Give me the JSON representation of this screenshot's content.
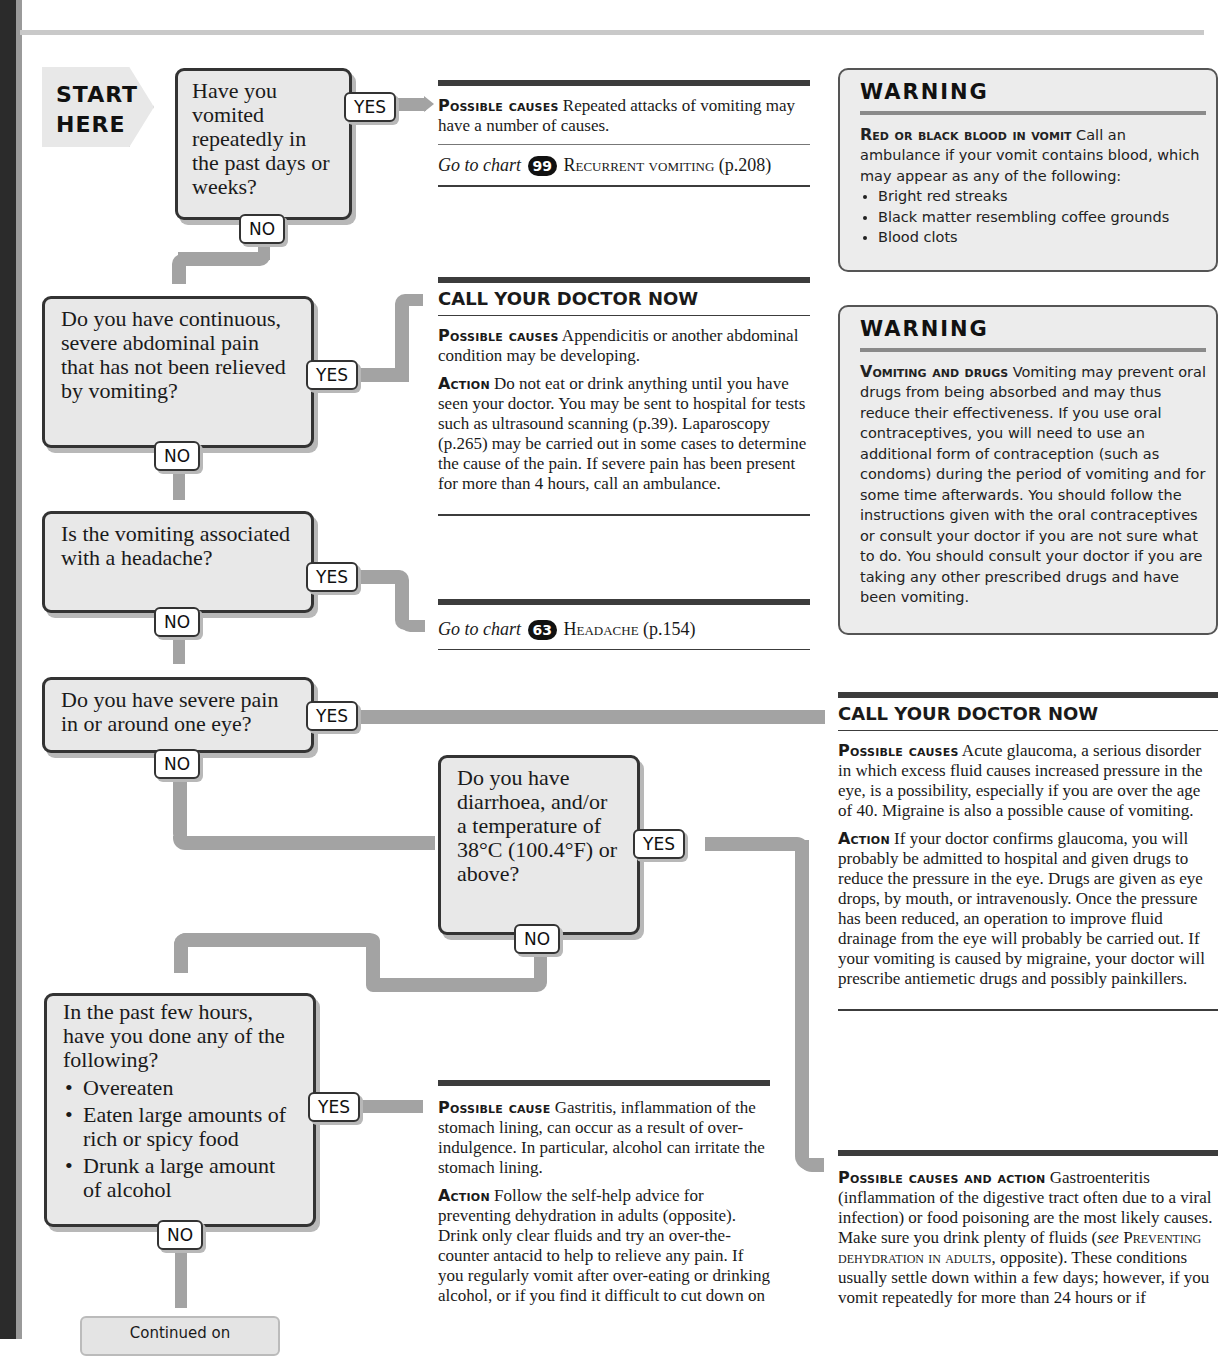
{
  "page": {
    "header_fragment": "…in the past, vigorous or sudden…",
    "start": {
      "line1": "START",
      "line2": "HERE"
    }
  },
  "labels": {
    "yes": "YES",
    "no": "NO"
  },
  "questions": [
    {
      "id": "q1",
      "text": "Have you vomited repeatedly in the past days or weeks?"
    },
    {
      "id": "q2",
      "text": "Do you have continuous, severe abdominal pain that has not been relieved by vomiting?"
    },
    {
      "id": "q3",
      "text": "Is the vomiting associated with a headache?"
    },
    {
      "id": "q4",
      "text": "Do you have severe pain in or around one eye?"
    },
    {
      "id": "q5",
      "text": "Do you have diarrhoea, and/or a temperature of 38°C (100.4°F) or above?"
    },
    {
      "id": "q6",
      "text": "In the past few hours, have you done any of the following?",
      "bullets": [
        "Overeaten",
        "Eaten large amounts of rich or spicy food",
        "Drunk a large amount of alcohol"
      ]
    }
  ],
  "outcomes": {
    "recurrent": {
      "lead": "Possible causes",
      "text": "Repeated attacks of vomiting may have a number of causes.",
      "goto_prefix": "Go to chart",
      "chart_number": "99",
      "chart_name": "Recurrent vomiting",
      "chart_page": "(p.208)"
    },
    "abdominal": {
      "heading": "CALL YOUR DOCTOR NOW",
      "causes_lead": "Possible causes",
      "causes_text": "Appendicitis or another abdominal condition may be developing.",
      "action_lead": "Action",
      "action_text": "Do not eat or drink anything until you have seen your doctor. You may be sent to hospital for tests such as ultrasound scanning (p.39). Laparoscopy (p.265) may be carried out in some cases to determine the cause of the pain. If severe pain has been present for more than 4 hours, call an ambulance."
    },
    "headache": {
      "goto_prefix": "Go to chart",
      "chart_number": "63",
      "chart_name": "Headache",
      "chart_page": "(p.154)"
    },
    "eye": {
      "heading": "CALL YOUR DOCTOR NOW",
      "causes_lead": "Possible causes",
      "causes_text": "Acute glaucoma, a serious disorder in which excess fluid causes increased pressure in the eye, is a possibility, especially if you are over the age of 40. Migraine is also a possible cause of vomiting.",
      "action_lead": "Action",
      "action_text": "If your doctor confirms glaucoma, you will probably be admitted to hospital and given drugs to reduce the pressure in the eye. Drugs are given as eye drops, by mouth, or intravenously. Once the pressure has been reduced, an operation to improve fluid drainage from the eye will probably be carried out. If your vomiting is caused by migraine, your doctor will prescribe antiemetic drugs and possibly painkillers."
    },
    "gastritis": {
      "causes_lead": "Possible cause",
      "causes_text": "Gastritis, inflammation of the stomach lining, can occur as a result of over-indulgence. In particular, alcohol can irritate the stomach lining.",
      "action_lead": "Action",
      "action_text": "Follow the self-help advice for preventing dehydration in adults (opposite). Drink only clear fluids and try an over-the-counter antacid to help to relieve any pain. If you regularly vomit after over-eating or drinking alcohol, or if you find it difficult to cut down on"
    },
    "gastroenteritis": {
      "lead": "Possible causes and action",
      "text_1": "Gastroenteritis (inflammation of the digestive tract often due to a viral infection) or food poisoning are the most likely causes. Make sure you drink plenty of fluids (",
      "see": "see",
      "ref": "Preventing dehydration in adults",
      "text_2": ", opposite). These conditions usually settle down within a few days; however, if you vomit repeatedly for more than 24 hours or if"
    }
  },
  "warnings": [
    {
      "title": "WARNING",
      "lead": "Red or black blood in vomit",
      "text": "Call an ambulance if your vomit contains blood, which may appear as any of the following:",
      "bullets": [
        "Bright red streaks",
        "Black matter resembling coffee grounds",
        "Blood clots"
      ]
    },
    {
      "title": "WARNING",
      "lead": "Vomiting and drugs",
      "text": "Vomiting may prevent oral drugs from being absorbed and may thus reduce their effectiveness. If you use oral contraceptives, you will need to use an additional form of contraception (such as condoms) during the period of vomiting and for some time afterwards. You should follow the instructions given with the oral contraceptives or consult your doctor if you are not sure what to do. You should consult your doctor if you are taking any other prescribed drugs and have been vomiting."
    }
  ],
  "continued": {
    "label": "Continued on"
  }
}
